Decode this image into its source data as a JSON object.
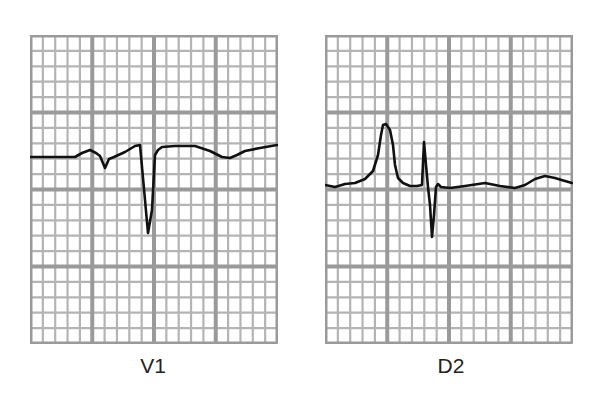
{
  "figure": {
    "colors": {
      "background": "#ffffff",
      "minor_grid": "#b4b4b4",
      "major_grid": "#9a9a9a",
      "trace": "#111111",
      "label": "#222222"
    },
    "grid": {
      "major_columns": 4,
      "major_rows": 4,
      "minor_per_major": 5
    },
    "panels": [
      {
        "label": "V1",
        "description": "Lead V1 ECG strip: small positive notch, small negative deflection, deep narrow QS/S wave, then elevated ST segment with a shallow wave",
        "trace_points": [
          [
            0,
            122
          ],
          [
            45,
            122
          ],
          [
            52,
            118
          ],
          [
            60,
            115
          ],
          [
            66,
            118
          ],
          [
            70,
            121
          ],
          [
            75,
            133
          ],
          [
            79,
            124
          ],
          [
            84,
            122
          ],
          [
            95,
            117
          ],
          [
            105,
            111
          ],
          [
            110,
            110
          ],
          [
            118,
            198
          ],
          [
            122,
            175
          ],
          [
            125,
            120
          ],
          [
            128,
            115
          ],
          [
            132,
            112
          ],
          [
            145,
            111
          ],
          [
            165,
            111
          ],
          [
            180,
            116
          ],
          [
            192,
            122
          ],
          [
            200,
            123
          ],
          [
            207,
            120
          ],
          [
            215,
            116
          ],
          [
            230,
            113
          ],
          [
            247,
            110
          ]
        ]
      },
      {
        "label": "D2",
        "description": "Lead D2 ECG strip: tall peaked P wave, narrow R spike followed by deep S wave, then near-baseline ST and low T wave",
        "trace_points": [
          [
            0,
            150
          ],
          [
            5,
            151
          ],
          [
            10,
            152
          ],
          [
            20,
            149
          ],
          [
            30,
            148
          ],
          [
            40,
            144
          ],
          [
            48,
            136
          ],
          [
            53,
            120
          ],
          [
            56,
            100
          ],
          [
            58,
            90
          ],
          [
            61,
            89
          ],
          [
            65,
            95
          ],
          [
            68,
            110
          ],
          [
            70,
            130
          ],
          [
            73,
            143
          ],
          [
            78,
            148
          ],
          [
            85,
            151
          ],
          [
            92,
            151
          ],
          [
            97,
            150
          ],
          [
            99,
            107
          ],
          [
            101,
            130
          ],
          [
            103,
            152
          ],
          [
            105,
            170
          ],
          [
            107,
            202
          ],
          [
            109,
            180
          ],
          [
            111,
            152
          ],
          [
            113,
            149
          ],
          [
            116,
            152
          ],
          [
            125,
            153
          ],
          [
            140,
            151
          ],
          [
            160,
            148
          ],
          [
            175,
            151
          ],
          [
            190,
            153
          ],
          [
            200,
            150
          ],
          [
            210,
            144
          ],
          [
            220,
            141
          ],
          [
            230,
            143
          ],
          [
            240,
            146
          ],
          [
            247,
            148
          ]
        ]
      }
    ]
  }
}
